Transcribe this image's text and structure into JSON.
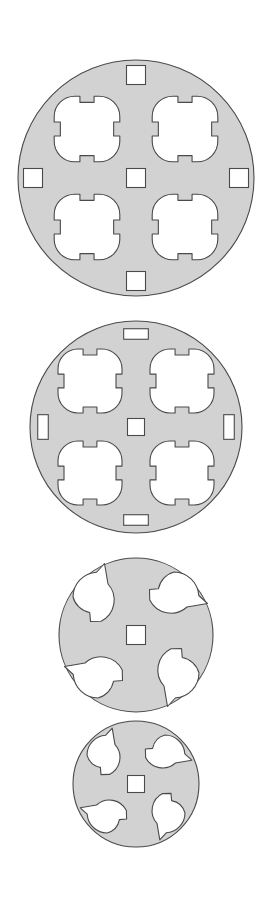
{
  "sheet": {
    "title": "Perforated Disk Cross-Sections",
    "background_color": "#ffffff",
    "width": 272,
    "height": 899,
    "figure_count": 4
  },
  "style": {
    "fill_color": "#d2d2d2",
    "stroke_color": "#4a4a4a",
    "hole_fill": "#ffffff",
    "stroke_width": 1.1
  },
  "figures": [
    {
      "id": "figure-1",
      "label": "Disk 1 - four quatrefoil cutouts, thick web",
      "center_x": 136,
      "center_y": 178,
      "radius": 118,
      "quatrefoil_count": 4,
      "quatrefoil_offset": 49,
      "quatrefoil_lobe_radius": 20.5,
      "quatrefoil_span": 41,
      "slot_count": 5,
      "slot_shape": "square",
      "slot_size": 19,
      "slot_positions": [
        "center",
        "top",
        "bottom",
        "left",
        "right"
      ],
      "slot_radial_offset": 103
    },
    {
      "id": "figure-2",
      "label": "Disk 2 - four quatrefoil cutouts, thin web with rectangular slots",
      "center_x": 136,
      "center_y": 427,
      "radius": 106,
      "quatrefoil_count": 4,
      "quatrefoil_offset": 46,
      "quatrefoil_lobe_radius": 20,
      "quatrefoil_span": 40,
      "slot_count": 5,
      "slot_shape": "rectangle",
      "slot_size": 17,
      "slot_positions": [
        "center",
        "top",
        "bottom",
        "left",
        "right"
      ],
      "slot_radial_offset": 93
    },
    {
      "id": "figure-3",
      "label": "Disk 3 - four teardrop cutouts, open ring",
      "center_x": 136,
      "center_y": 635,
      "radius": 77,
      "cutout_count": 4,
      "cutout_shape": "teardrop",
      "cutout_offset": 38,
      "cutout_radius": 25,
      "slot_count": 1,
      "slot_shape": "square",
      "slot_size": 19,
      "slot_positions": [
        "center"
      ]
    },
    {
      "id": "figure-4",
      "label": "Disk 4 - four teardrop cutouts, solid rim",
      "center_x": 136,
      "center_y": 784,
      "radius": 63,
      "cutout_count": 4,
      "cutout_shape": "teardrop",
      "cutout_offset": 29,
      "cutout_radius": 20,
      "slot_count": 1,
      "slot_shape": "square",
      "slot_size": 17,
      "slot_positions": [
        "center"
      ]
    }
  ]
}
